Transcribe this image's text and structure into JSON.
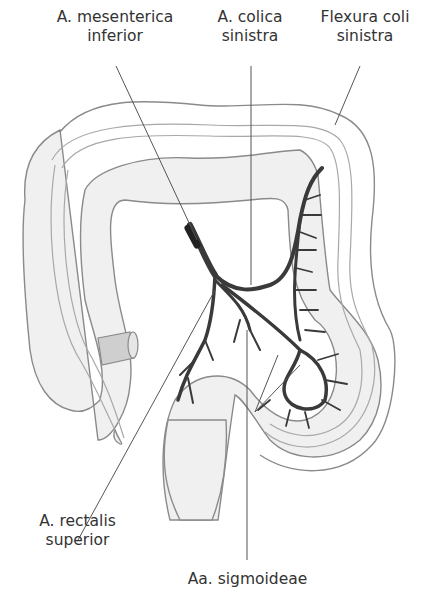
{
  "diagram": {
    "labels": {
      "mesenterica": {
        "line1": "A. mesenterica",
        "line2": "inferior"
      },
      "colica": {
        "line1": "A. colica",
        "line2": "sinistra"
      },
      "flexura": {
        "line1": "Flexura coli",
        "line2": "sinistra"
      },
      "rectalis": {
        "line1": "A. rectalis",
        "line2": "superior"
      },
      "sigmoideae": {
        "line1": "Aa. sigmoideae"
      }
    },
    "colors": {
      "colon_fill": "#f0f0f0",
      "colon_outline": "#8a8a8a",
      "artery": "#3a3a3a",
      "leader_line": "#555555",
      "text": "#333333"
    }
  }
}
